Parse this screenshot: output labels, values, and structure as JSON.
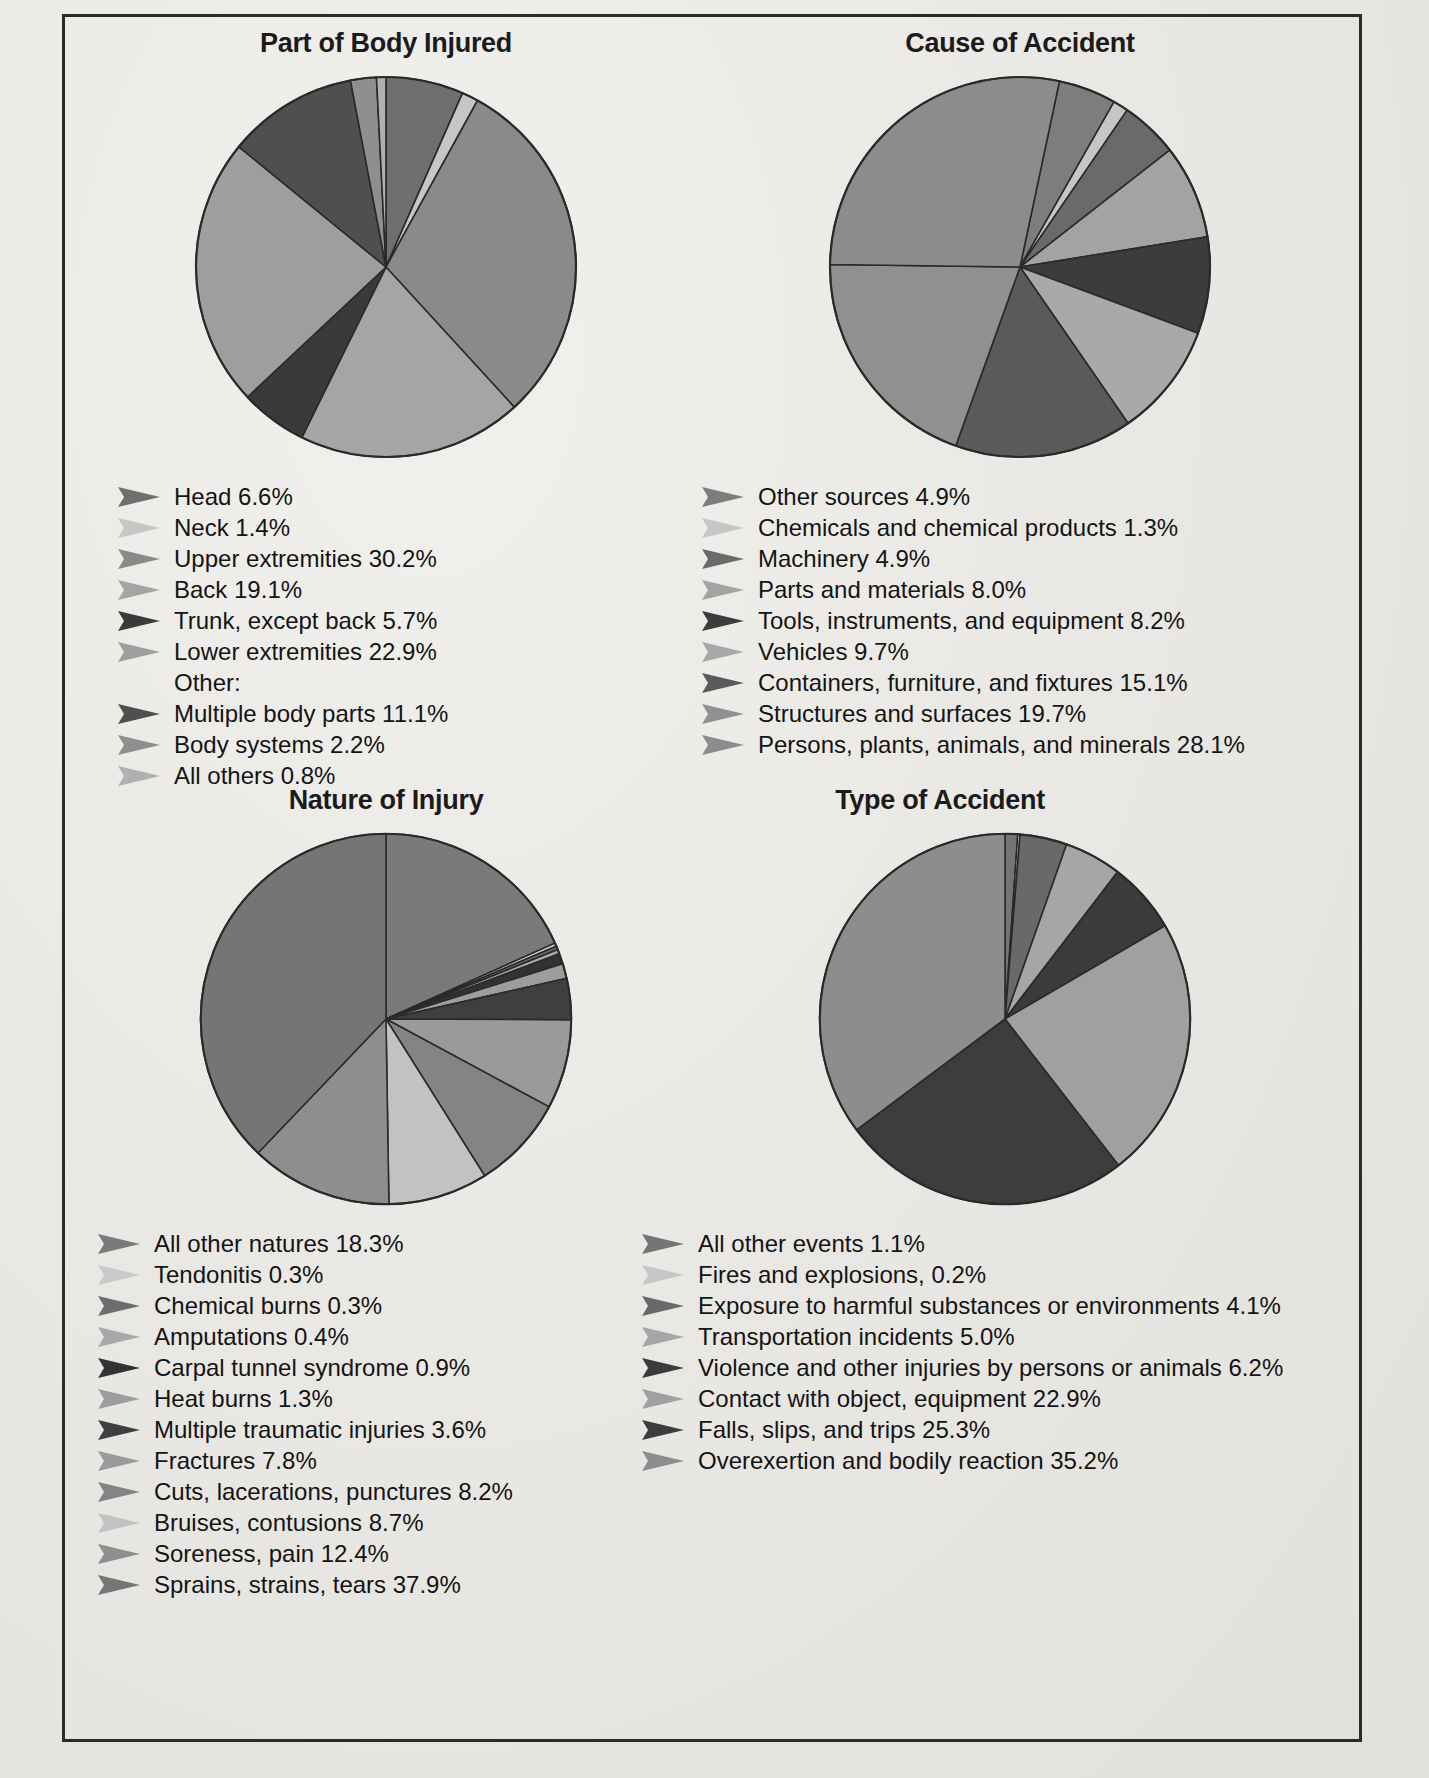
{
  "page": {
    "background_color": "#e9e7e3",
    "frame_color": "#2b2b2b"
  },
  "palette": {
    "g1": "#6f6f6f",
    "g2": "#b9b9b9",
    "g3": "#8a8a8a",
    "g4": "#a5a5a5",
    "g5": "#3a3a3a",
    "g6": "#999999",
    "g7": "#5c5c5c",
    "g8": "#7d7d7d",
    "g9": "#cfcfcf",
    "g10": "#4a4a4a",
    "g11": "#8f8f8f",
    "g12": "#646464"
  },
  "charts": [
    {
      "id": "part-of-body-injured",
      "title": "Part of Body Injured",
      "chart_data": {
        "type": "pie",
        "title": "Part of Body Injured",
        "unit": "percent",
        "legend_position": "below",
        "labels": [
          "Head",
          "Neck",
          "Upper extremities",
          "Back",
          "Trunk, except back",
          "Lower extremities",
          "Multiple body parts",
          "Body systems",
          "All others"
        ],
        "values": [
          6.6,
          1.4,
          30.2,
          19.1,
          5.7,
          22.9,
          11.1,
          2.2,
          0.8
        ],
        "colors": [
          "#6f6f6f",
          "#c6c6c6",
          "#8a8a8a",
          "#a5a5a5",
          "#3a3a3a",
          "#9e9e9e",
          "#4f4f4f",
          "#8f8f8f",
          "#b0b0b0"
        ]
      },
      "legend": [
        {
          "label": "Head 6.6%",
          "color": "#6f6f6f",
          "sub": false,
          "marker": true
        },
        {
          "label": "Neck 1.4%",
          "color": "#c6c6c6",
          "sub": false,
          "marker": true
        },
        {
          "label": "Upper extremities 30.2%",
          "color": "#8a8a8a",
          "sub": false,
          "marker": true
        },
        {
          "label": "Back 19.1%",
          "color": "#a5a5a5",
          "sub": false,
          "marker": true
        },
        {
          "label": "Trunk, except back 5.7%",
          "color": "#3a3a3a",
          "sub": false,
          "marker": true
        },
        {
          "label": "Lower extremities 22.9%",
          "color": "#9e9e9e",
          "sub": false,
          "marker": true
        },
        {
          "label": "Other:",
          "color": null,
          "sub": false,
          "marker": false
        },
        {
          "label": "Multiple body parts 11.1%",
          "color": "#4f4f4f",
          "sub": true,
          "marker": true
        },
        {
          "label": "Body systems 2.2%",
          "color": "#8f8f8f",
          "sub": true,
          "marker": true
        },
        {
          "label": "All others 0.8%",
          "color": "#b0b0b0",
          "sub": true,
          "marker": true
        }
      ]
    },
    {
      "id": "cause-of-accident",
      "title": "Cause of Accident",
      "chart_data": {
        "type": "pie",
        "title": "Cause of Accident",
        "unit": "percent",
        "legend_position": "below",
        "labels": [
          "Other sources",
          "Chemicals and chemical products",
          "Machinery",
          "Parts and materials",
          "Tools, instruments, and equipment",
          "Vehicles",
          "Containers, furniture, and fixtures",
          "Structures and surfaces",
          "Persons, plants, animals, and minerals"
        ],
        "values": [
          4.9,
          1.3,
          4.9,
          8.0,
          8.2,
          9.7,
          15.1,
          19.7,
          28.1
        ],
        "colors": [
          "#7d7d7d",
          "#c6c6c6",
          "#6a6a6a",
          "#a3a3a3",
          "#3c3c3c",
          "#a9a9a9",
          "#5a5a5a",
          "#909090",
          "#8c8c8c"
        ]
      },
      "legend": [
        {
          "label": "Other sources 4.9%",
          "color": "#7d7d7d",
          "sub": false,
          "marker": true
        },
        {
          "label": "Chemicals and chemical products 1.3%",
          "color": "#c6c6c6",
          "sub": false,
          "marker": true
        },
        {
          "label": "Machinery 4.9%",
          "color": "#6a6a6a",
          "sub": false,
          "marker": true
        },
        {
          "label": "Parts and materials 8.0%",
          "color": "#a3a3a3",
          "sub": false,
          "marker": true
        },
        {
          "label": "Tools, instruments, and equipment 8.2%",
          "color": "#3c3c3c",
          "sub": false,
          "marker": true
        },
        {
          "label": "Vehicles 9.7%",
          "color": "#a9a9a9",
          "sub": false,
          "marker": true
        },
        {
          "label": "Containers, furniture, and fixtures 15.1%",
          "color": "#5a5a5a",
          "sub": false,
          "marker": true
        },
        {
          "label": "Structures and surfaces 19.7%",
          "color": "#909090",
          "sub": false,
          "marker": true
        },
        {
          "label": "Persons, plants, animals, and minerals 28.1%",
          "color": "#8c8c8c",
          "sub": false,
          "marker": true
        }
      ]
    },
    {
      "id": "nature-of-injury",
      "title": "Nature of Injury",
      "chart_data": {
        "type": "pie",
        "title": "Nature of Injury",
        "unit": "percent",
        "legend_position": "below",
        "labels": [
          "All other natures",
          "Tendonitis",
          "Chemical burns",
          "Amputations",
          "Carpal tunnel syndrome",
          "Heat burns",
          "Multiple traumatic injuries",
          "Fractures",
          "Cuts, lacerations, punctures",
          "Bruises, contusions",
          "Soreness, pain",
          "Sprains, strains, tears"
        ],
        "values": [
          18.3,
          0.3,
          0.3,
          0.4,
          0.9,
          1.3,
          3.6,
          7.8,
          8.2,
          8.7,
          12.4,
          37.9
        ],
        "colors": [
          "#7a7a7a",
          "#c9c9c9",
          "#6d6d6d",
          "#a8a8a8",
          "#333333",
          "#9d9d9d",
          "#3f3f3f",
          "#9a9a9a",
          "#848484",
          "#c2c2c2",
          "#8e8e8e",
          "#757575"
        ]
      },
      "legend": [
        {
          "label": "All other natures 18.3%",
          "color": "#7a7a7a",
          "sub": false,
          "marker": true
        },
        {
          "label": "Tendonitis 0.3%",
          "color": "#c9c9c9",
          "sub": false,
          "marker": true
        },
        {
          "label": "Chemical burns 0.3%",
          "color": "#6d6d6d",
          "sub": false,
          "marker": true
        },
        {
          "label": "Amputations 0.4%",
          "color": "#a8a8a8",
          "sub": false,
          "marker": true
        },
        {
          "label": "Carpal tunnel syndrome 0.9%",
          "color": "#333333",
          "sub": false,
          "marker": true
        },
        {
          "label": "Heat burns 1.3%",
          "color": "#9d9d9d",
          "sub": false,
          "marker": true
        },
        {
          "label": "Multiple traumatic injuries 3.6%",
          "color": "#3f3f3f",
          "sub": false,
          "marker": true
        },
        {
          "label": "Fractures 7.8%",
          "color": "#9a9a9a",
          "sub": false,
          "marker": true
        },
        {
          "label": "Cuts, lacerations, punctures 8.2%",
          "color": "#848484",
          "sub": false,
          "marker": true
        },
        {
          "label": "Bruises, contusions 8.7%",
          "color": "#c2c2c2",
          "sub": false,
          "marker": true
        },
        {
          "label": "Soreness, pain 12.4%",
          "color": "#8e8e8e",
          "sub": false,
          "marker": true
        },
        {
          "label": "Sprains, strains, tears 37.9%",
          "color": "#757575",
          "sub": false,
          "marker": true
        }
      ]
    },
    {
      "id": "type-of-accident",
      "title": "Type of Accident",
      "chart_data": {
        "type": "pie",
        "title": "Type of Accident",
        "unit": "percent",
        "legend_position": "below",
        "labels": [
          "All other events",
          "Fires and explosions,",
          "Exposure to harmful substances or environments",
          "Transportation incidents",
          "Violence and other injuries by persons or animals",
          "Contact with object, equipment",
          "Falls, slips, and trips",
          "Overexertion and bodily reaction"
        ],
        "values": [
          1.1,
          0.2,
          4.1,
          5.0,
          6.2,
          22.9,
          25.3,
          35.2
        ],
        "colors": [
          "#757575",
          "#c6c6c6",
          "#696969",
          "#a6a6a6",
          "#3b3b3b",
          "#a0a0a0",
          "#3d3d3d",
          "#8d8d8d"
        ]
      },
      "legend": [
        {
          "label": "All other events 1.1%",
          "color": "#757575",
          "sub": false,
          "marker": true
        },
        {
          "label": "Fires and explosions, 0.2%",
          "color": "#c6c6c6",
          "sub": false,
          "marker": true
        },
        {
          "label": "Exposure to harmful substances or environments 4.1%",
          "color": "#696969",
          "sub": false,
          "marker": true
        },
        {
          "label": "Transportation incidents 5.0%",
          "color": "#a6a6a6",
          "sub": false,
          "marker": true
        },
        {
          "label": "Violence and other injuries by persons or animals 6.2%",
          "color": "#3b3b3b",
          "sub": false,
          "marker": true
        },
        {
          "label": "Contact with object, equipment 22.9%",
          "color": "#a0a0a0",
          "sub": false,
          "marker": true
        },
        {
          "label": "Falls, slips, and trips 25.3%",
          "color": "#3d3d3d",
          "sub": false,
          "marker": true
        },
        {
          "label": "Overexertion and bodily reaction 35.2%",
          "color": "#8d8d8d",
          "sub": false,
          "marker": true
        }
      ]
    }
  ]
}
